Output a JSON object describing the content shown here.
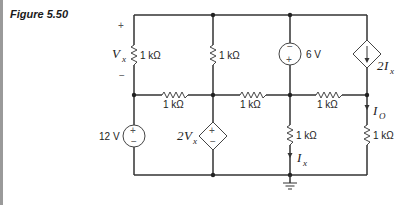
{
  "figure": {
    "title": "Figure 5.50"
  },
  "circuit": {
    "resistors": [
      {
        "id": "R_vx",
        "label": "1 kΩ"
      },
      {
        "id": "R_top_mid",
        "label": "1 kΩ"
      },
      {
        "id": "R_mid_left",
        "label": "1 kΩ"
      },
      {
        "id": "R_mid_center",
        "label": "1 kΩ"
      },
      {
        "id": "R_mid_right",
        "label": "1 kΩ"
      },
      {
        "id": "R_ix",
        "label": "1 kΩ"
      },
      {
        "id": "R_io",
        "label": "1 kΩ"
      }
    ],
    "sources": {
      "v12": {
        "label": "12 V",
        "plus": "+",
        "minus": "−"
      },
      "v6": {
        "label": "6 V",
        "plus": "+",
        "minus": "−"
      },
      "dep_v": {
        "label_coef": "2",
        "label_var": "V",
        "label_sub": "x",
        "plus": "+",
        "minus": "−"
      },
      "dep_i": {
        "label_coef": "2",
        "label_var": "I",
        "label_sub": "x"
      }
    },
    "labels": {
      "vx_var": "V",
      "vx_sub": "x",
      "vx_plus": "+",
      "vx_minus": "−",
      "ix_var": "I",
      "ix_sub": "x",
      "io_var": "I",
      "io_sub": "O"
    }
  }
}
